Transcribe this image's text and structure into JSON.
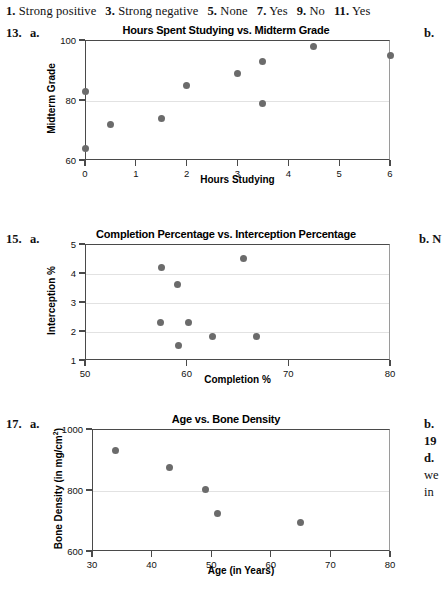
{
  "answer_key": {
    "items": [
      {
        "number": "1.",
        "text": "Strong positive"
      },
      {
        "number": "3.",
        "text": "Strong negative"
      },
      {
        "number": "5.",
        "text": "None"
      },
      {
        "number": "7.",
        "text": "Yes"
      },
      {
        "number": "9.",
        "text": "No"
      },
      {
        "number": "11.",
        "text": "Yes"
      }
    ]
  },
  "problems": [
    {
      "number": "13.",
      "part": "a.",
      "margin_part": "b."
    },
    {
      "number": "15.",
      "part": "a.",
      "margin_part": "b.  N"
    },
    {
      "number": "17.",
      "part": "a.",
      "margin_lines": [
        "b.",
        "19",
        "d.",
        "we",
        "in"
      ]
    }
  ],
  "chart_data": [
    {
      "id": "chart-13a",
      "type": "scatter",
      "title": "Hours Spent Studying vs. Midterm Grade",
      "xlabel": "Hours Studying",
      "ylabel": "Midterm Grade",
      "xlim": [
        0,
        6
      ],
      "ylim": [
        60,
        100
      ],
      "xticks": [
        0,
        1,
        2,
        3,
        4,
        5,
        6
      ],
      "xtick_labels": [
        "0",
        "1",
        "2",
        "3",
        "4",
        "5",
        "6"
      ],
      "yticks": [
        60,
        80,
        100
      ],
      "ytick_labels": [
        "60",
        "80",
        "100"
      ],
      "gridlines": [
        80
      ],
      "grid": true,
      "legend": null,
      "points": [
        {
          "x": 0,
          "y": 64
        },
        {
          "x": 0,
          "y": 83
        },
        {
          "x": 0.5,
          "y": 72
        },
        {
          "x": 1.5,
          "y": 74
        },
        {
          "x": 2,
          "y": 85
        },
        {
          "x": 3,
          "y": 89
        },
        {
          "x": 3.5,
          "y": 79
        },
        {
          "x": 3.5,
          "y": 93
        },
        {
          "x": 4.5,
          "y": 98
        },
        {
          "x": 6,
          "y": 95
        }
      ]
    },
    {
      "id": "chart-15a",
      "type": "scatter",
      "title": "Completion Percentage vs. Interception Percentage",
      "xlabel": "Completion %",
      "ylabel": "Interception %",
      "xlim": [
        50,
        80
      ],
      "ylim": [
        1,
        5
      ],
      "xticks": [
        50,
        60,
        70,
        80
      ],
      "xtick_labels": [
        "50",
        "60",
        "70",
        "80"
      ],
      "yticks": [
        1,
        2,
        3,
        4,
        5
      ],
      "ytick_labels": [
        "1",
        "2",
        "3",
        "4",
        "5"
      ],
      "gridlines": [
        2,
        3,
        4
      ],
      "grid": true,
      "legend": null,
      "points": [
        {
          "x": 57.5,
          "y": 4.2
        },
        {
          "x": 59.1,
          "y": 3.6
        },
        {
          "x": 65.6,
          "y": 4.5
        },
        {
          "x": 57.4,
          "y": 2.3
        },
        {
          "x": 60.2,
          "y": 2.3
        },
        {
          "x": 59.2,
          "y": 1.5
        },
        {
          "x": 62.5,
          "y": 1.8
        },
        {
          "x": 66.9,
          "y": 1.8
        }
      ]
    },
    {
      "id": "chart-17a",
      "type": "scatter",
      "title": "Age vs. Bone Density",
      "xlabel": "Age (in Years)",
      "ylabel": "Bone Density (in mg/cm",
      "ylabel_sup": "2",
      "ylabel_suffix": ")",
      "xlim": [
        30,
        80
      ],
      "ylim": [
        600,
        1000
      ],
      "xticks": [
        30,
        40,
        50,
        60,
        70,
        80
      ],
      "xtick_labels": [
        "30",
        "40",
        "50",
        "60",
        "70",
        "80"
      ],
      "yticks": [
        600,
        800,
        1000
      ],
      "ytick_labels": [
        "600",
        "800",
        "1000"
      ],
      "gridlines": [
        800
      ],
      "grid": true,
      "legend": null,
      "points": [
        {
          "x": 34,
          "y": 930
        },
        {
          "x": 43,
          "y": 873
        },
        {
          "x": 49,
          "y": 803
        },
        {
          "x": 51,
          "y": 723
        },
        {
          "x": 65,
          "y": 692
        }
      ]
    }
  ],
  "colors": {
    "dot": "#6b6b6b",
    "axis": "#4a4a4a",
    "grid": "#e2e2e2",
    "text": "#111111"
  }
}
